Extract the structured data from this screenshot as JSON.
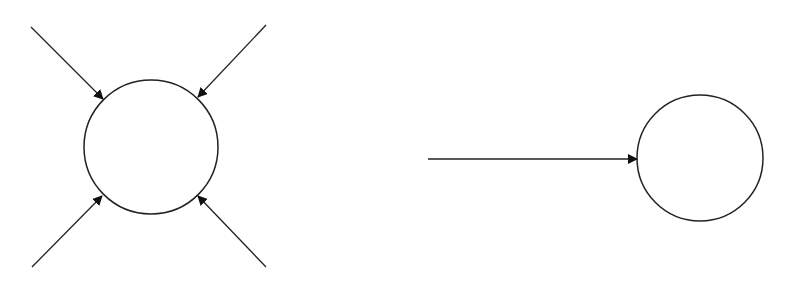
{
  "diagram": {
    "background": "#ffffff",
    "stroke_color": "#222222",
    "left_group": {
      "circle": {
        "cx": 151,
        "cy": 147,
        "r": 67
      },
      "arrows": [
        {
          "name": "arrow-top-left",
          "x1": 31,
          "y1": 27,
          "x2": 103,
          "y2": 99
        },
        {
          "name": "arrow-top-right",
          "x1": 266,
          "y1": 25,
          "x2": 198,
          "y2": 97
        },
        {
          "name": "arrow-bottom-left",
          "x1": 32,
          "y1": 267,
          "x2": 102,
          "y2": 196
        },
        {
          "name": "arrow-bottom-right",
          "x1": 266,
          "y1": 267,
          "x2": 198,
          "y2": 196
        }
      ]
    },
    "right_group": {
      "circle": {
        "cx": 700,
        "cy": 158,
        "r": 63
      },
      "arrows": [
        {
          "name": "arrow-horizontal",
          "x1": 428,
          "y1": 159,
          "x2": 637,
          "y2": 159
        }
      ]
    }
  }
}
